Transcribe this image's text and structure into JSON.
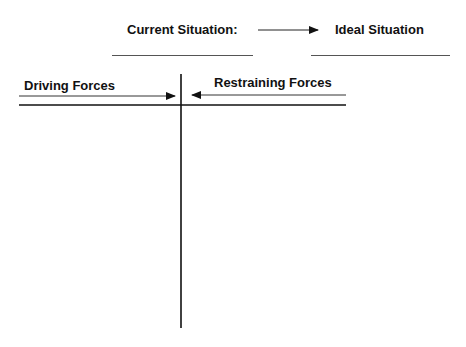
{
  "header": {
    "current_label": "Current Situation:",
    "ideal_label": "Ideal Situation",
    "current_blank": "",
    "ideal_blank": ""
  },
  "columns": {
    "left_title": "Driving Forces",
    "right_title": "Restraining Forces"
  },
  "colors": {
    "ink": "#111111",
    "blank_line": "#555555",
    "background": "#ffffff"
  }
}
